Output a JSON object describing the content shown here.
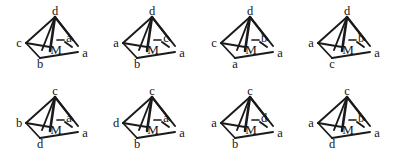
{
  "figure": {
    "type": "chemical-structure-diagram",
    "rows": 2,
    "columns": 4,
    "line_color": "#1a1a1a",
    "text_color": "#141414",
    "background_color": "#ffffff",
    "metal_label": "M"
  },
  "structures": [
    {
      "id": "structure-1",
      "index": "1",
      "metal": "M",
      "apex": "d",
      "left": "c",
      "bottom": "b",
      "right": "a",
      "inner": "a"
    },
    {
      "id": "structure-2",
      "index": "2",
      "metal": "M",
      "apex": "d",
      "left": "a",
      "bottom": "b",
      "right": "a",
      "inner": "c"
    },
    {
      "id": "structure-3",
      "index": "3",
      "metal": "M",
      "apex": "d",
      "left": "c",
      "bottom": "a",
      "right": "a",
      "inner": "b"
    },
    {
      "id": "structure-4",
      "index": "4",
      "metal": "M",
      "apex": "d",
      "left": "a",
      "bottom": "c",
      "right": "a",
      "inner": "b"
    },
    {
      "id": "structure-5",
      "index": "5",
      "metal": "M",
      "apex": "c",
      "left": "b",
      "bottom": "d",
      "right": "a",
      "inner": "a"
    },
    {
      "id": "structure-6",
      "index": "6",
      "metal": "M",
      "apex": "c",
      "left": "d",
      "bottom": "b",
      "right": "a",
      "inner": "a"
    },
    {
      "id": "structure-7",
      "index": "7",
      "metal": "M",
      "apex": "c",
      "left": "a",
      "bottom": "b",
      "right": "a",
      "inner": "d"
    },
    {
      "id": "structure-8",
      "index": "8",
      "metal": "M",
      "apex": "c",
      "left": "a",
      "bottom": "d",
      "right": "a",
      "inner": "b"
    }
  ]
}
